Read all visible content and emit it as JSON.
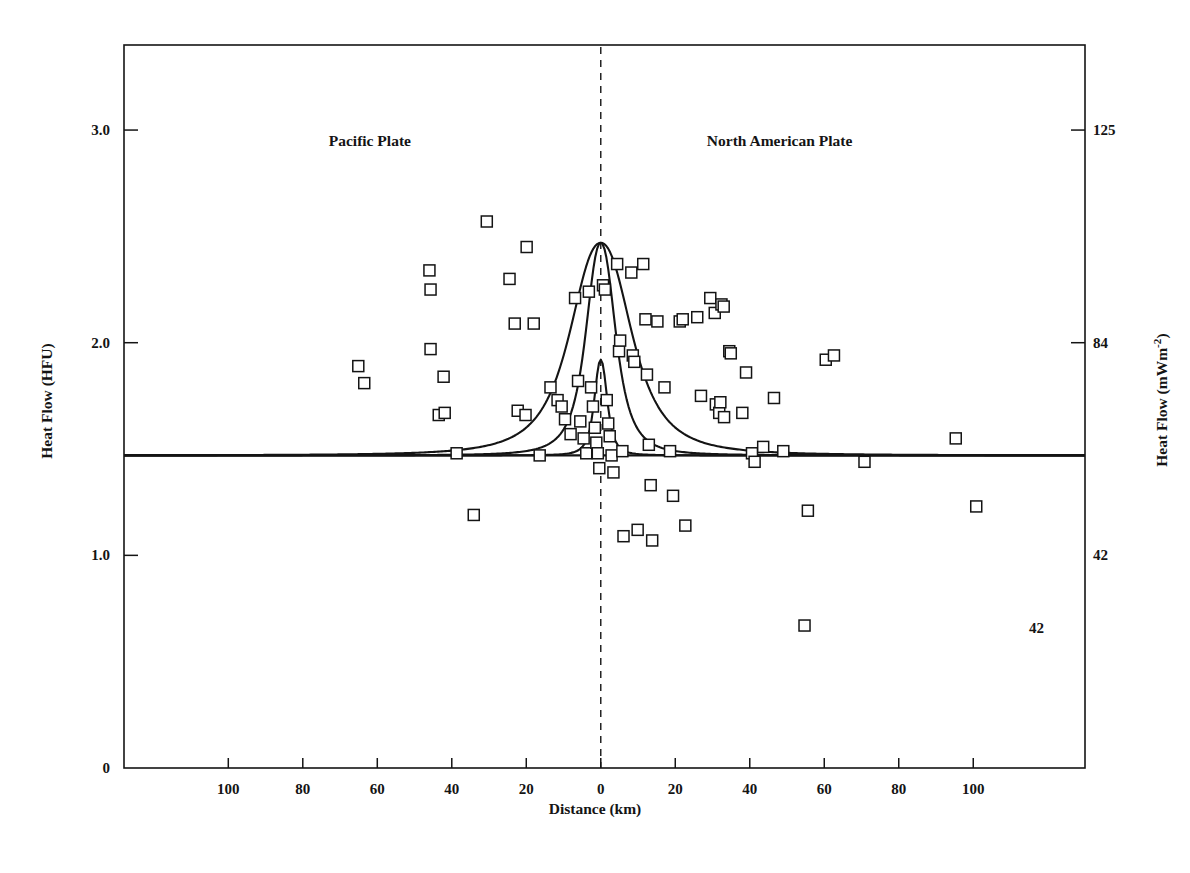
{
  "figure": {
    "domain": "chart",
    "background": "#ffffff",
    "ink_color": "#141414"
  },
  "axes": {
    "left": {
      "title": "Heat Flow (HFU)",
      "ticks": [
        {
          "label": "3.0",
          "value": 3.0
        },
        {
          "label": "2.0",
          "value": 2.0
        },
        {
          "label": "1.0",
          "value": 1.0
        },
        {
          "label": "0",
          "value": 0.0
        }
      ],
      "range": [
        0.0,
        3.4
      ]
    },
    "right": {
      "title_main": "Heat Flow (mWm",
      "title_sup": "-2",
      "title_tail": ")",
      "title_plain": "Heat Flow (mWm-2)",
      "ticks": [
        {
          "label": "125",
          "value": 3.0
        },
        {
          "label": "84",
          "value": 2.0
        },
        {
          "label": "42",
          "value": 1.0
        }
      ]
    },
    "bottom": {
      "title": "Distance (km)",
      "ticks": [
        {
          "label": "100",
          "value": -100
        },
        {
          "label": "80",
          "value": -80
        },
        {
          "label": "60",
          "value": -60
        },
        {
          "label": "40",
          "value": -40
        },
        {
          "label": "20",
          "value": -20
        },
        {
          "label": "0",
          "value": 0
        },
        {
          "label": "20",
          "value": 20
        },
        {
          "label": "40",
          "value": 40
        },
        {
          "label": "60",
          "value": 60
        },
        {
          "label": "80",
          "value": 80
        },
        {
          "label": "100",
          "value": 100
        }
      ],
      "range": [
        -128,
        130
      ]
    }
  },
  "annotations": {
    "plate_left": "Pacific Plate",
    "plate_right": "North American Plate",
    "plate_left_x": -62,
    "plate_right_x": 48,
    "plate_label_y": 2.95,
    "inner_note": "42",
    "inner_note_x": 117,
    "inner_note_y": 0.66
  },
  "chart_data": {
    "type": "scatter",
    "title": "",
    "xlabel": "Distance (km)",
    "ylabel": "Heat Flow (HFU)",
    "ylabel_secondary": "Heat Flow (mWm-2)",
    "xlim": [
      -128,
      130
    ],
    "ylim": [
      0.0,
      3.4
    ],
    "grid": false,
    "legend": false,
    "marker": "open-square",
    "background_level": {
      "label": "regional background heat flow",
      "value": 1.47,
      "style": "solid horizontal line"
    },
    "fault_trace": {
      "label": "fault trace",
      "value": 0,
      "style": "vertical dashed line"
    },
    "points": [
      {
        "x": -65.1,
        "y": 1.89
      },
      {
        "x": -63.5,
        "y": 1.81
      },
      {
        "x": -45.7,
        "y": 1.97
      },
      {
        "x": -46.0,
        "y": 2.34
      },
      {
        "x": -45.7,
        "y": 2.25
      },
      {
        "x": -42.2,
        "y": 1.84
      },
      {
        "x": -43.5,
        "y": 1.66
      },
      {
        "x": -41.9,
        "y": 1.67
      },
      {
        "x": -38.7,
        "y": 1.48
      },
      {
        "x": -34.1,
        "y": 1.19
      },
      {
        "x": -30.6,
        "y": 2.57
      },
      {
        "x": -24.5,
        "y": 2.3
      },
      {
        "x": -23.1,
        "y": 2.09
      },
      {
        "x": -22.3,
        "y": 1.68
      },
      {
        "x": -20.2,
        "y": 1.66
      },
      {
        "x": -19.9,
        "y": 2.45
      },
      {
        "x": -18.0,
        "y": 2.09
      },
      {
        "x": -16.4,
        "y": 1.47
      },
      {
        "x": -13.5,
        "y": 1.79
      },
      {
        "x": -11.6,
        "y": 1.73
      },
      {
        "x": -10.5,
        "y": 1.7
      },
      {
        "x": -9.6,
        "y": 1.64
      },
      {
        "x": -8.1,
        "y": 1.57
      },
      {
        "x": -6.9,
        "y": 2.21
      },
      {
        "x": -6.1,
        "y": 1.82
      },
      {
        "x": -5.5,
        "y": 1.63
      },
      {
        "x": -4.6,
        "y": 1.55
      },
      {
        "x": -3.9,
        "y": 1.48
      },
      {
        "x": -3.2,
        "y": 2.24
      },
      {
        "x": -2.6,
        "y": 1.79
      },
      {
        "x": -2.1,
        "y": 1.7
      },
      {
        "x": -1.6,
        "y": 1.6
      },
      {
        "x": -1.2,
        "y": 1.53
      },
      {
        "x": -0.8,
        "y": 1.48
      },
      {
        "x": -0.4,
        "y": 1.41
      },
      {
        "x": 0.6,
        "y": 2.27
      },
      {
        "x": 1.1,
        "y": 2.25
      },
      {
        "x": 1.6,
        "y": 1.73
      },
      {
        "x": 2.0,
        "y": 1.62
      },
      {
        "x": 2.4,
        "y": 1.56
      },
      {
        "x": 2.9,
        "y": 1.47
      },
      {
        "x": 3.4,
        "y": 1.39
      },
      {
        "x": 4.4,
        "y": 2.37
      },
      {
        "x": 4.9,
        "y": 1.96
      },
      {
        "x": 5.2,
        "y": 2.01
      },
      {
        "x": 5.8,
        "y": 1.49
      },
      {
        "x": 6.1,
        "y": 1.09
      },
      {
        "x": 8.2,
        "y": 2.33
      },
      {
        "x": 8.6,
        "y": 1.94
      },
      {
        "x": 9.0,
        "y": 1.91
      },
      {
        "x": 9.9,
        "y": 1.12
      },
      {
        "x": 11.4,
        "y": 2.37
      },
      {
        "x": 12.0,
        "y": 2.11
      },
      {
        "x": 12.4,
        "y": 1.85
      },
      {
        "x": 12.9,
        "y": 1.52
      },
      {
        "x": 13.4,
        "y": 1.33
      },
      {
        "x": 13.8,
        "y": 1.07
      },
      {
        "x": 15.2,
        "y": 2.1
      },
      {
        "x": 17.1,
        "y": 1.79
      },
      {
        "x": 18.6,
        "y": 1.49
      },
      {
        "x": 19.4,
        "y": 1.28
      },
      {
        "x": 21.2,
        "y": 2.1
      },
      {
        "x": 22.0,
        "y": 2.11
      },
      {
        "x": 22.7,
        "y": 1.14
      },
      {
        "x": 25.9,
        "y": 2.12
      },
      {
        "x": 26.9,
        "y": 1.75
      },
      {
        "x": 29.4,
        "y": 2.21
      },
      {
        "x": 30.6,
        "y": 2.14
      },
      {
        "x": 30.9,
        "y": 1.71
      },
      {
        "x": 31.8,
        "y": 1.67
      },
      {
        "x": 32.4,
        "y": 2.18
      },
      {
        "x": 33.0,
        "y": 2.17
      },
      {
        "x": 32.1,
        "y": 1.72
      },
      {
        "x": 33.1,
        "y": 1.65
      },
      {
        "x": 34.5,
        "y": 1.96
      },
      {
        "x": 34.9,
        "y": 1.95
      },
      {
        "x": 38.0,
        "y": 1.67
      },
      {
        "x": 39.0,
        "y": 1.86
      },
      {
        "x": 40.6,
        "y": 1.48
      },
      {
        "x": 41.3,
        "y": 1.44
      },
      {
        "x": 43.6,
        "y": 1.51
      },
      {
        "x": 46.5,
        "y": 1.74
      },
      {
        "x": 49.0,
        "y": 1.49
      },
      {
        "x": 54.7,
        "y": 0.67
      },
      {
        "x": 55.6,
        "y": 1.21
      },
      {
        "x": 60.4,
        "y": 1.92
      },
      {
        "x": 62.6,
        "y": 1.94
      },
      {
        "x": 70.8,
        "y": 1.44
      },
      {
        "x": 95.3,
        "y": 1.55
      },
      {
        "x": 100.8,
        "y": 1.23
      }
    ],
    "curves": [
      {
        "name": "wide frictional-heating model",
        "peak": 2.47,
        "baseline": 1.47,
        "half_width_km": 9.5,
        "style": "solid"
      },
      {
        "name": "intermediate frictional-heating model",
        "peak": 2.47,
        "baseline": 1.47,
        "half_width_km": 4.6,
        "style": "solid"
      },
      {
        "name": "narrow frictional-heating model",
        "peak": 1.92,
        "baseline": 1.47,
        "half_width_km": 2.0,
        "style": "solid"
      }
    ]
  }
}
